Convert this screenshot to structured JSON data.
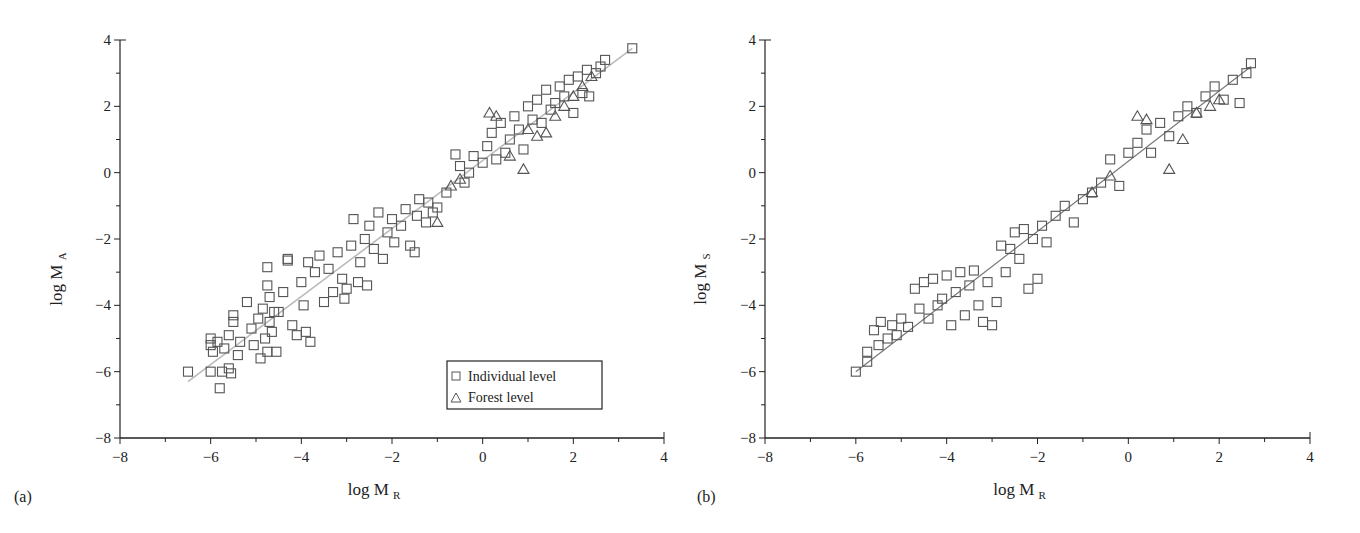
{
  "figure": {
    "panels": [
      {
        "id": "a",
        "panel_label": "(a)",
        "xlabel_main": "log M",
        "xlabel_sub": "R",
        "ylabel_main": "log M",
        "ylabel_sub": "A"
      },
      {
        "id": "b",
        "panel_label": "(b)",
        "xlabel_main": "log M",
        "xlabel_sub": "R",
        "ylabel_main": "log M",
        "ylabel_sub": "S"
      }
    ],
    "legend": {
      "items": [
        {
          "marker": "square",
          "label": "Individual level"
        },
        {
          "marker": "triangle",
          "label": "Forest level"
        }
      ]
    },
    "colors": {
      "marker_stroke": "#555555",
      "fit_line_a": "#bbbbbb",
      "fit_line_b": "#777777",
      "axis": "#222222"
    }
  },
  "chart_data": [
    {
      "type": "scatter",
      "title": "(a)",
      "xlabel": "log M_R",
      "ylabel": "log M_A",
      "xlim": [
        -8,
        4
      ],
      "ylim": [
        -8,
        4
      ],
      "xticks": [
        -8,
        -6,
        -4,
        -2,
        0,
        2,
        4
      ],
      "yticks": [
        -8,
        -6,
        -4,
        -2,
        0,
        2,
        4
      ],
      "grid": false,
      "legend_position": "lower right",
      "fit_line": {
        "x": [
          -6.5,
          3.3
        ],
        "y": [
          -6.3,
          3.75
        ]
      },
      "series": [
        {
          "name": "Individual level",
          "marker": "square",
          "points": [
            [
              -6.5,
              -6.0
            ],
            [
              -6.0,
              -6.0
            ],
            [
              -5.8,
              -6.5
            ],
            [
              -5.75,
              -6.0
            ],
            [
              -5.55,
              -6.05
            ],
            [
              -5.6,
              -5.9
            ],
            [
              -6.0,
              -5.0
            ],
            [
              -6.0,
              -5.2
            ],
            [
              -5.95,
              -5.4
            ],
            [
              -5.85,
              -5.1
            ],
            [
              -5.7,
              -5.3
            ],
            [
              -5.6,
              -4.9
            ],
            [
              -5.5,
              -4.5
            ],
            [
              -5.5,
              -4.3
            ],
            [
              -5.4,
              -5.5
            ],
            [
              -5.35,
              -5.1
            ],
            [
              -5.2,
              -3.9
            ],
            [
              -5.1,
              -4.7
            ],
            [
              -5.05,
              -5.2
            ],
            [
              -4.95,
              -4.4
            ],
            [
              -4.9,
              -5.6
            ],
            [
              -4.85,
              -4.1
            ],
            [
              -4.8,
              -5.0
            ],
            [
              -4.75,
              -5.4
            ],
            [
              -4.7,
              -4.5
            ],
            [
              -4.7,
              -3.75
            ],
            [
              -4.65,
              -4.8
            ],
            [
              -4.6,
              -4.2
            ],
            [
              -4.55,
              -5.4
            ],
            [
              -4.75,
              -3.4
            ],
            [
              -4.75,
              -2.85
            ],
            [
              -4.5,
              -4.2
            ],
            [
              -4.4,
              -3.6
            ],
            [
              -4.3,
              -2.6
            ],
            [
              -4.3,
              -2.65
            ],
            [
              -4.2,
              -4.6
            ],
            [
              -4.1,
              -4.9
            ],
            [
              -4.0,
              -3.3
            ],
            [
              -3.95,
              -4.0
            ],
            [
              -3.9,
              -4.8
            ],
            [
              -3.8,
              -5.1
            ],
            [
              -3.85,
              -2.7
            ],
            [
              -3.7,
              -3.0
            ],
            [
              -3.6,
              -2.5
            ],
            [
              -3.5,
              -3.9
            ],
            [
              -3.4,
              -2.9
            ],
            [
              -3.3,
              -3.6
            ],
            [
              -3.2,
              -2.4
            ],
            [
              -3.1,
              -3.2
            ],
            [
              -3.05,
              -3.8
            ],
            [
              -3.0,
              -3.5
            ],
            [
              -2.9,
              -2.2
            ],
            [
              -2.85,
              -1.4
            ],
            [
              -2.75,
              -3.3
            ],
            [
              -2.7,
              -2.7
            ],
            [
              -2.6,
              -2.0
            ],
            [
              -2.55,
              -3.4
            ],
            [
              -2.5,
              -1.6
            ],
            [
              -2.4,
              -2.3
            ],
            [
              -2.3,
              -1.2
            ],
            [
              -2.2,
              -2.6
            ],
            [
              -2.1,
              -1.8
            ],
            [
              -2.0,
              -1.4
            ],
            [
              -1.95,
              -2.1
            ],
            [
              -1.8,
              -1.6
            ],
            [
              -1.7,
              -1.1
            ],
            [
              -1.6,
              -2.2
            ],
            [
              -1.5,
              -2.4
            ],
            [
              -1.45,
              -1.3
            ],
            [
              -1.4,
              -0.8
            ],
            [
              -1.25,
              -1.5
            ],
            [
              -1.2,
              -0.9
            ],
            [
              -1.1,
              -1.2
            ],
            [
              -1.0,
              -1.05
            ],
            [
              -0.8,
              -0.6
            ],
            [
              -0.6,
              0.55
            ],
            [
              -0.5,
              0.2
            ],
            [
              -0.4,
              -0.3
            ],
            [
              -0.3,
              0.0
            ],
            [
              -0.2,
              0.5
            ],
            [
              0.0,
              0.3
            ],
            [
              0.1,
              0.8
            ],
            [
              0.2,
              1.2
            ],
            [
              0.3,
              0.4
            ],
            [
              0.4,
              1.5
            ],
            [
              0.5,
              0.6
            ],
            [
              0.6,
              1.0
            ],
            [
              0.7,
              1.7
            ],
            [
              0.8,
              1.3
            ],
            [
              0.9,
              0.7
            ],
            [
              1.0,
              2.0
            ],
            [
              1.1,
              1.6
            ],
            [
              1.2,
              2.2
            ],
            [
              1.3,
              1.5
            ],
            [
              1.4,
              2.5
            ],
            [
              1.5,
              1.9
            ],
            [
              1.6,
              2.1
            ],
            [
              1.7,
              2.6
            ],
            [
              1.8,
              2.3
            ],
            [
              1.9,
              2.8
            ],
            [
              2.0,
              1.8
            ],
            [
              2.1,
              2.9
            ],
            [
              2.2,
              2.4
            ],
            [
              2.3,
              3.1
            ],
            [
              2.35,
              2.3
            ],
            [
              2.5,
              3.0
            ],
            [
              2.6,
              3.2
            ],
            [
              2.7,
              3.4
            ],
            [
              3.3,
              3.75
            ]
          ]
        },
        {
          "name": "Forest level",
          "marker": "triangle",
          "points": [
            [
              0.15,
              1.8
            ],
            [
              0.3,
              1.7
            ],
            [
              0.6,
              0.5
            ],
            [
              0.9,
              0.1
            ],
            [
              1.0,
              1.3
            ],
            [
              1.2,
              1.1
            ],
            [
              1.4,
              1.2
            ],
            [
              1.6,
              1.7
            ],
            [
              1.8,
              2.0
            ],
            [
              2.0,
              2.3
            ],
            [
              2.2,
              2.6
            ],
            [
              2.4,
              2.9
            ],
            [
              -0.7,
              -0.4
            ],
            [
              -1.0,
              -1.5
            ],
            [
              -0.5,
              -0.2
            ]
          ]
        }
      ]
    },
    {
      "type": "scatter",
      "title": "(b)",
      "xlabel": "log M_R",
      "ylabel": "log M_S",
      "xlim": [
        -8,
        4
      ],
      "ylim": [
        -8,
        4
      ],
      "xticks": [
        -8,
        -6,
        -4,
        -2,
        0,
        2,
        4
      ],
      "yticks": [
        -8,
        -6,
        -4,
        -2,
        0,
        2,
        4
      ],
      "grid": false,
      "fit_line": {
        "x": [
          -6.0,
          2.7
        ],
        "y": [
          -6.0,
          3.2
        ]
      },
      "series": [
        {
          "name": "Individual level",
          "marker": "square",
          "points": [
            [
              -6.0,
              -6.0
            ],
            [
              -5.75,
              -5.7
            ],
            [
              -5.75,
              -5.4
            ],
            [
              -5.5,
              -5.2
            ],
            [
              -5.6,
              -4.75
            ],
            [
              -5.45,
              -4.5
            ],
            [
              -5.3,
              -5.0
            ],
            [
              -5.2,
              -4.6
            ],
            [
              -5.1,
              -4.9
            ],
            [
              -5.0,
              -4.4
            ],
            [
              -4.85,
              -4.65
            ],
            [
              -4.7,
              -3.5
            ],
            [
              -4.6,
              -4.1
            ],
            [
              -4.5,
              -3.3
            ],
            [
              -4.4,
              -4.4
            ],
            [
              -4.3,
              -3.2
            ],
            [
              -4.2,
              -4.0
            ],
            [
              -4.1,
              -3.8
            ],
            [
              -4.0,
              -3.1
            ],
            [
              -3.9,
              -4.6
            ],
            [
              -3.8,
              -3.6
            ],
            [
              -3.7,
              -3.0
            ],
            [
              -3.6,
              -4.3
            ],
            [
              -3.5,
              -3.4
            ],
            [
              -3.4,
              -2.95
            ],
            [
              -3.3,
              -4.0
            ],
            [
              -3.2,
              -4.5
            ],
            [
              -3.1,
              -3.3
            ],
            [
              -3.0,
              -4.6
            ],
            [
              -2.9,
              -3.9
            ],
            [
              -2.8,
              -2.2
            ],
            [
              -2.7,
              -3.0
            ],
            [
              -2.6,
              -2.3
            ],
            [
              -2.5,
              -1.8
            ],
            [
              -2.4,
              -2.6
            ],
            [
              -2.3,
              -1.7
            ],
            [
              -2.2,
              -3.5
            ],
            [
              -2.1,
              -2.0
            ],
            [
              -2.0,
              -3.2
            ],
            [
              -1.9,
              -1.6
            ],
            [
              -1.8,
              -2.1
            ],
            [
              -1.6,
              -1.3
            ],
            [
              -1.4,
              -1.0
            ],
            [
              -1.2,
              -1.5
            ],
            [
              -1.0,
              -0.8
            ],
            [
              -0.8,
              -0.6
            ],
            [
              -0.6,
              -0.3
            ],
            [
              -0.4,
              0.4
            ],
            [
              -0.2,
              -0.4
            ],
            [
              0.0,
              0.6
            ],
            [
              0.2,
              0.9
            ],
            [
              0.4,
              1.3
            ],
            [
              0.5,
              0.6
            ],
            [
              0.7,
              1.5
            ],
            [
              0.9,
              1.1
            ],
            [
              1.1,
              1.7
            ],
            [
              1.3,
              2.0
            ],
            [
              1.5,
              1.8
            ],
            [
              1.7,
              2.3
            ],
            [
              1.9,
              2.6
            ],
            [
              2.1,
              2.2
            ],
            [
              2.3,
              2.8
            ],
            [
              2.45,
              2.1
            ],
            [
              2.6,
              3.0
            ],
            [
              2.7,
              3.3
            ]
          ]
        },
        {
          "name": "Forest level",
          "marker": "triangle",
          "points": [
            [
              0.2,
              1.7
            ],
            [
              0.4,
              1.6
            ],
            [
              0.9,
              0.1
            ],
            [
              1.2,
              1.0
            ],
            [
              1.5,
              1.8
            ],
            [
              1.8,
              2.0
            ],
            [
              2.0,
              2.2
            ],
            [
              -0.4,
              -0.1
            ],
            [
              -0.8,
              -0.6
            ]
          ]
        }
      ]
    }
  ]
}
